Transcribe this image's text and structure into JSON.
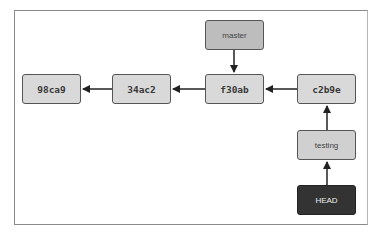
{
  "diagram": {
    "type": "git-branch-graph",
    "commits": [
      {
        "id": "98ca9",
        "label": "98ca9"
      },
      {
        "id": "34ac2",
        "label": "34ac2"
      },
      {
        "id": "f30ab",
        "label": "f30ab"
      },
      {
        "id": "c2b9e",
        "label": "c2b9e"
      }
    ],
    "refs": [
      {
        "id": "master",
        "label": "master",
        "points_to": "f30ab"
      },
      {
        "id": "testing",
        "label": "testing",
        "points_to": "c2b9e"
      },
      {
        "id": "head",
        "label": "HEAD",
        "points_to": "testing"
      }
    ],
    "edges": [
      {
        "from": "34ac2",
        "to": "98ca9"
      },
      {
        "from": "f30ab",
        "to": "34ac2"
      },
      {
        "from": "c2b9e",
        "to": "f30ab"
      },
      {
        "from": "master",
        "to": "f30ab"
      },
      {
        "from": "testing",
        "to": "c2b9e"
      },
      {
        "from": "HEAD",
        "to": "testing"
      }
    ],
    "colors": {
      "commit_fill": "#d9d9d9",
      "branch_fill": "#bdbdbd",
      "head_fill": "#333333",
      "stroke": "#555555",
      "arrow": "#222222"
    }
  }
}
